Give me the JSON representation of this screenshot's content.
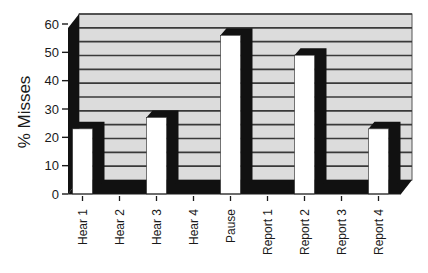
{
  "chart_data": {
    "type": "bar",
    "style": "3d-column",
    "title": "",
    "xlabel": "",
    "ylabel": "% Misses",
    "ylim": [
      0,
      60
    ],
    "yticks": [
      0,
      10,
      20,
      30,
      40,
      50,
      60
    ],
    "gridline_step": 5,
    "grid": true,
    "legend": null,
    "categories": [
      "Hear 1",
      "Hear 2",
      "Hear 3",
      "Hear 4",
      "Pause",
      "Report 1",
      "Report 2",
      "Report 3",
      "Report 4"
    ],
    "values": [
      23,
      0,
      27,
      0,
      56,
      0,
      49,
      0,
      23
    ]
  },
  "colors": {
    "back_wall": "#dcdcdc",
    "side_wall": "#111111",
    "gridline": "#3a3a3a",
    "bar_face": "#ffffff",
    "bar_shadow": "#111111",
    "axis": "#1a1a1a",
    "text": "#1a1a1a"
  }
}
